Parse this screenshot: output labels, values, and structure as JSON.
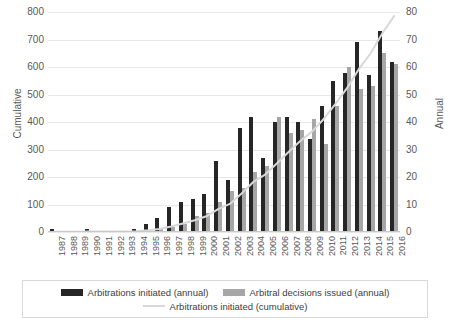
{
  "chart_data": {
    "type": "bar",
    "title": "",
    "xlabel": "",
    "ylabel": "Cumulative",
    "y2label": "Annual",
    "ylim": [
      0,
      800
    ],
    "y2lim": [
      0,
      80
    ],
    "yticks": [
      0,
      100,
      200,
      300,
      400,
      500,
      600,
      700,
      800
    ],
    "y2ticks": [
      0,
      10,
      20,
      30,
      40,
      50,
      60,
      70,
      80
    ],
    "grid": true,
    "legend_position": "bottom",
    "categories": [
      "1987",
      "1988",
      "1989",
      "1990",
      "1991",
      "1992",
      "1993",
      "1994",
      "1995",
      "1996",
      "1997",
      "1998",
      "1999",
      "2000",
      "2001",
      "2002",
      "2003",
      "2004",
      "2005",
      "2006",
      "2007",
      "2008",
      "2009",
      "2010",
      "2011",
      "2012",
      "2013",
      "2014",
      "2015",
      "2016"
    ],
    "series": [
      {
        "name": "Arbitrations initiated (annual)",
        "axis": "right",
        "color": "#262626",
        "values": [
          1,
          0,
          0,
          1,
          0,
          0,
          0,
          1,
          3,
          5,
          9,
          11,
          12,
          14,
          26,
          19,
          38,
          42,
          27,
          40,
          42,
          40,
          34,
          46,
          55,
          58,
          69,
          57,
          73,
          62
        ]
      },
      {
        "name": "Arbitral decisions issued (annual)",
        "axis": "right",
        "color": "#a6a6a6",
        "values": [
          0,
          0,
          0,
          0,
          0,
          0,
          0,
          0,
          0,
          1,
          2,
          3,
          6,
          7,
          11,
          15,
          16,
          22,
          24,
          42,
          36,
          37,
          41,
          32,
          46,
          60,
          52,
          53,
          65,
          61
        ]
      },
      {
        "name": "Arbitrations initiated (cumulative)",
        "axis": "left",
        "color": "#d9d9d9",
        "type": "line",
        "values": [
          1,
          1,
          1,
          2,
          2,
          2,
          2,
          3,
          6,
          11,
          20,
          31,
          43,
          57,
          83,
          102,
          140,
          182,
          209,
          249,
          291,
          331,
          365,
          411,
          466,
          524,
          593,
          650,
          723,
          785
        ]
      }
    ]
  },
  "legend": {
    "items": [
      {
        "label": "Arbitrations initiated (annual)",
        "swatch": "bar-initiated"
      },
      {
        "label": "Arbitral decisions issued (annual)",
        "swatch": "bar-decisions"
      },
      {
        "label": "Arbitrations initiated (cumulative)",
        "swatch": "line-cumulative"
      }
    ]
  }
}
